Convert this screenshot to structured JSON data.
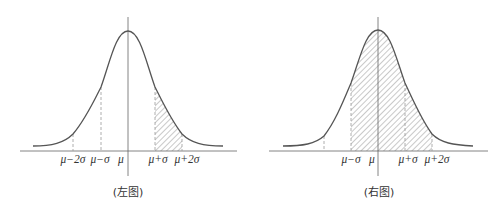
{
  "figures": [
    {
      "id": "left",
      "caption": "(左图)",
      "shaded_region": "μ+σ to μ+2σ",
      "dashed_lines_at": [
        "μ-2σ",
        "μ-σ",
        "μ+σ",
        "μ+2σ"
      ],
      "tick_labels": {
        "mu_minus_2sigma": "μ−2σ",
        "mu_minus_sigma": "μ−σ",
        "mu": "μ",
        "mu_plus_sigma": "μ+σ",
        "mu_plus_2sigma": "μ+2σ"
      }
    },
    {
      "id": "right",
      "caption": "(右图)",
      "shaded_region": "μ-σ to μ+2σ",
      "dashed_lines_at": [
        "μ-2σ",
        "μ-σ",
        "μ+σ",
        "μ+2σ"
      ],
      "tick_labels": {
        "mu_minus_sigma": "μ−σ",
        "mu": "μ",
        "mu_plus_sigma": "μ+σ",
        "mu_plus_2sigma": "μ+2σ"
      }
    }
  ],
  "colors": {
    "curve": "#555555",
    "axis": "#666666",
    "dashed": "#999999",
    "hatch": "#777777"
  }
}
